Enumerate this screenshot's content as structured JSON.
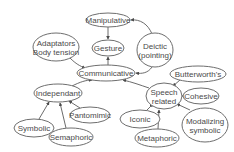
{
  "diagram": {
    "type": "gesture-taxonomy-graph",
    "nodes": [
      {
        "id": "manipulative",
        "label": [
          "Manipulative"
        ],
        "cx": 108,
        "cy": 20,
        "rx": 22,
        "ry": 7
      },
      {
        "id": "gesture",
        "label": [
          "Gesture"
        ],
        "cx": 108,
        "cy": 48,
        "rx": 16,
        "ry": 8
      },
      {
        "id": "adaptators",
        "label": [
          "Adaptators",
          "Body tension"
        ],
        "cx": 56,
        "cy": 47,
        "rx": 23,
        "ry": 14
      },
      {
        "id": "deictic",
        "label": [
          "Deictic",
          "(pointing)"
        ],
        "cx": 155,
        "cy": 50,
        "rx": 18,
        "ry": 17
      },
      {
        "id": "communicative",
        "label": [
          "Communicative"
        ],
        "cx": 106,
        "cy": 73,
        "rx": 29,
        "ry": 8
      },
      {
        "id": "butterworths",
        "label": [
          "Butterworth's"
        ],
        "cx": 198,
        "cy": 74,
        "rx": 28,
        "ry": 8
      },
      {
        "id": "independant",
        "label": [
          "Independant"
        ],
        "cx": 58,
        "cy": 93,
        "rx": 24,
        "ry": 9
      },
      {
        "id": "speech",
        "label": [
          "Speech",
          "related"
        ],
        "cx": 164,
        "cy": 96,
        "rx": 18,
        "ry": 13
      },
      {
        "id": "cohesive",
        "label": [
          "Cohesive"
        ],
        "cx": 201,
        "cy": 96,
        "rx": 18,
        "ry": 8
      },
      {
        "id": "pantomimic",
        "label": [
          "Pantomimic"
        ],
        "cx": 90,
        "cy": 115,
        "rx": 20,
        "ry": 8
      },
      {
        "id": "iconic",
        "label": [
          "Iconic"
        ],
        "cx": 140,
        "cy": 119,
        "rx": 20,
        "ry": 9
      },
      {
        "id": "modalizing",
        "label": [
          "Modalizing",
          "symbolic"
        ],
        "cx": 205,
        "cy": 125,
        "rx": 23,
        "ry": 17
      },
      {
        "id": "symbolic",
        "label": [
          "Symbolic"
        ],
        "cx": 34,
        "cy": 128,
        "rx": 20,
        "ry": 9
      },
      {
        "id": "semaphoric",
        "label": [
          "Semaphoric"
        ],
        "cx": 71,
        "cy": 137,
        "rx": 22,
        "ry": 9
      },
      {
        "id": "metaphoric",
        "label": [
          "Metaphoric"
        ],
        "cx": 157,
        "cy": 138,
        "rx": 22,
        "ry": 9
      }
    ],
    "edges": [
      {
        "from": "manipulative",
        "to": "gesture",
        "path": "M108,27 L108,39"
      },
      {
        "from": "deictic",
        "to": "manipulative",
        "path": "M152,34 C148,24 140,19 131,20"
      },
      {
        "from": "communicative",
        "to": "gesture",
        "path": "M108,65 L108,57"
      },
      {
        "from": "adaptators",
        "to": "communicative",
        "path": "M70,58 C76,64 80,66 85,68"
      },
      {
        "from": "deictic",
        "to": "communicative",
        "path": "M152,67 C148,73 142,74 136,73"
      },
      {
        "from": "independant",
        "to": "communicative",
        "path": "M72,86 C80,82 86,80 92,80"
      },
      {
        "from": "speech",
        "to": "communicative",
        "path": "M149,88 C140,85 132,82 123,80"
      },
      {
        "from": "butterworths",
        "to": "speech",
        "path": "M180,80 L173,86"
      },
      {
        "from": "cohesive",
        "to": "speech",
        "path": "M183,96 L183,96 L183,96"
      },
      {
        "from": "modalizing",
        "to": "speech",
        "path": "M190,110 L177,104"
      },
      {
        "from": "metaphoric",
        "to": "speech",
        "path": "M158,129 L159,110"
      },
      {
        "from": "iconic",
        "to": "speech",
        "path": "M147,110 L153,104"
      },
      {
        "from": "symbolic",
        "to": "independant",
        "path": "M39,119 L49,102"
      },
      {
        "from": "semaphoric",
        "to": "independant",
        "path": "M66,128 L60,103"
      },
      {
        "from": "pantomimic",
        "to": "independant",
        "path": "M80,108 L69,101"
      }
    ]
  }
}
